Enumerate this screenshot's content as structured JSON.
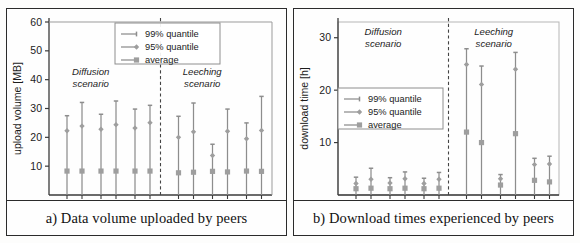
{
  "figure": {
    "panels": [
      {
        "id": "a",
        "caption": "a) Data volume uploaded by peers",
        "ylabel": "upload volume [MB]",
        "yticks": [
          10,
          20,
          30,
          40,
          50,
          60
        ],
        "ymax": 60,
        "xaxis_label": "#PU:",
        "scenarios": [
          "Diffusion scenario",
          "Leeching scenario"
        ],
        "scenario_lines": [
          [
            "Diffusion",
            "scenario"
          ],
          [
            "Leeching",
            "scenario"
          ]
        ],
        "groups": [
          "random",
          "LSF",
          "CycPriM"
        ],
        "levels": [
          "1",
          "4"
        ],
        "legend": [
          "99% quantile",
          "95% quantile",
          "average"
        ]
      },
      {
        "id": "b",
        "caption": "b) Download times experienced by peers",
        "ylabel": "download time [h]",
        "yticks": [
          10,
          20,
          30
        ],
        "ymax": 33,
        "xaxis_label": "#PU:",
        "scenarios": [
          "Diffusion scenario",
          "Leeching scenario"
        ],
        "scenario_lines": [
          [
            "Diffusion",
            "scenario"
          ],
          [
            "Leeching",
            "scenario"
          ]
        ],
        "groups": [
          "random",
          "LSF",
          "CycPriM"
        ],
        "levels": [
          "1",
          "4"
        ],
        "legend": [
          "99% quantile",
          "95% quantile",
          "average"
        ]
      }
    ]
  },
  "chart_data": [
    {
      "type": "scatter",
      "title": "a) Data volume uploaded by peers",
      "xlabel": "#PU:",
      "ylabel": "upload volume [MB]",
      "ylim": [
        0,
        60
      ],
      "yticks": [
        10,
        20,
        30,
        40,
        50,
        60
      ],
      "grid": false,
      "legend_position": "top-center",
      "series": [
        {
          "name": "99% quantile",
          "marker": "line-top-cap",
          "color": "#7a7a7a"
        },
        {
          "name": "95% quantile",
          "marker": "diamond",
          "color": "#8a8a8a"
        },
        {
          "name": "average",
          "marker": "square",
          "color": "#9a9a9a"
        }
      ],
      "categories": [
        "Diffusion/random/1",
        "Diffusion/random/4",
        "Diffusion/LSF/1",
        "Diffusion/LSF/4",
        "Diffusion/CycPriM/1",
        "Diffusion/CycPriM/4",
        "Leeching/random/1",
        "Leeching/random/4",
        "Leeching/LSF/1",
        "Leeching/LSF/4",
        "Leeching/CycPriM/1",
        "Leeching/CycPriM/4"
      ],
      "points": [
        {
          "category": "Diffusion/random/1",
          "q99": 27.5,
          "q95": 22.3,
          "average": 8.3
        },
        {
          "category": "Diffusion/random/4",
          "q99": 32.1,
          "q95": 23.9,
          "average": 8.3
        },
        {
          "category": "Diffusion/LSF/1",
          "q99": 28.0,
          "q95": 22.8,
          "average": 8.3
        },
        {
          "category": "Diffusion/LSF/4",
          "q99": 32.6,
          "q95": 24.4,
          "average": 8.3
        },
        {
          "category": "Diffusion/CycPriM/1",
          "q99": 29.8,
          "q95": 23.2,
          "average": 8.3
        },
        {
          "category": "Diffusion/CycPriM/4",
          "q99": 31.1,
          "q95": 25.1,
          "average": 8.3
        },
        {
          "category": "Leeching/random/1",
          "q99": 27.3,
          "q95": 20.0,
          "average": 7.7
        },
        {
          "category": "Leeching/random/4",
          "q99": 31.9,
          "q95": 21.9,
          "average": 7.9
        },
        {
          "category": "Leeching/LSF/1",
          "q99": 17.6,
          "q95": 13.7,
          "average": 8.2
        },
        {
          "category": "Leeching/LSF/4",
          "q99": 29.8,
          "q95": 22.1,
          "average": 8.0
        },
        {
          "category": "Leeching/CycPriM/1",
          "q99": 25.0,
          "q95": 19.5,
          "average": 8.3
        },
        {
          "category": "Leeching/CycPriM/4",
          "q99": 34.2,
          "q95": 22.4,
          "average": 8.2
        }
      ]
    },
    {
      "type": "scatter",
      "title": "b) Download times experienced by peers",
      "xlabel": "#PU:",
      "ylabel": "download time [h]",
      "ylim": [
        0,
        33
      ],
      "yticks": [
        10,
        20,
        30
      ],
      "grid": false,
      "legend_position": "middle-left",
      "series": [
        {
          "name": "99% quantile",
          "marker": "line-top-cap",
          "color": "#7a7a7a"
        },
        {
          "name": "95% quantile",
          "marker": "diamond",
          "color": "#8a8a8a"
        },
        {
          "name": "average",
          "marker": "square",
          "color": "#9a9a9a"
        }
      ],
      "categories": [
        "Diffusion/random/1",
        "Diffusion/random/4",
        "Diffusion/LSF/1",
        "Diffusion/LSF/4",
        "Diffusion/CycPriM/1",
        "Diffusion/CycPriM/4",
        "Leeching/random/1",
        "Leeching/random/4",
        "Leeching/LSF/1",
        "Leeching/LSF/4",
        "Leeching/CycPriM/1",
        "Leeching/CycPriM/4"
      ],
      "points": [
        {
          "category": "Diffusion/random/1",
          "q99": 3.4,
          "q95": 2.2,
          "average": 1.2
        },
        {
          "category": "Diffusion/random/4",
          "q99": 5.1,
          "q95": 3.0,
          "average": 1.3
        },
        {
          "category": "Diffusion/LSF/1",
          "q99": 3.3,
          "q95": 2.3,
          "average": 1.2
        },
        {
          "category": "Diffusion/LSF/4",
          "q99": 4.4,
          "q95": 3.1,
          "average": 1.3
        },
        {
          "category": "Diffusion/CycPriM/1",
          "q99": 3.2,
          "q95": 2.2,
          "average": 1.2
        },
        {
          "category": "Diffusion/CycPriM/4",
          "q99": 4.3,
          "q95": 3.0,
          "average": 1.3
        },
        {
          "category": "Leeching/random/1",
          "q99": 27.9,
          "q95": 24.9,
          "average": 12.0
        },
        {
          "category": "Leeching/random/4",
          "q99": 24.6,
          "q95": 21.1,
          "average": 10.0
        },
        {
          "category": "Leeching/LSF/1",
          "q99": 3.9,
          "q95": 3.1,
          "average": 1.9
        },
        {
          "category": "Leeching/LSF/4",
          "q99": 27.2,
          "q95": 24.0,
          "average": 11.7
        },
        {
          "category": "Leeching/CycPriM/1",
          "q99": 7.0,
          "q95": 5.8,
          "average": 2.8
        },
        {
          "category": "Leeching/CycPriM/4",
          "q99": 7.4,
          "q95": 5.9,
          "average": 2.5
        }
      ]
    }
  ]
}
